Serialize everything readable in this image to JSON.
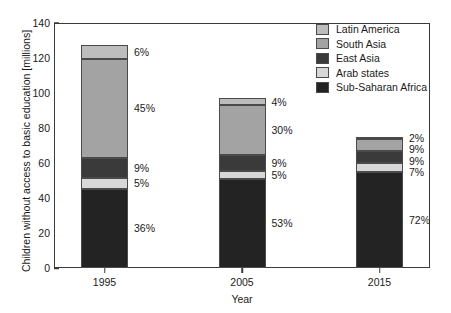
{
  "chart_data": {
    "type": "bar",
    "stacked": true,
    "title": "",
    "xlabel": "Year",
    "ylabel": "Children without access to basic education [millions]",
    "categories": [
      "1995",
      "2005",
      "2015"
    ],
    "ylim": [
      0,
      140
    ],
    "yticks": [
      0,
      20,
      40,
      60,
      80,
      100,
      120,
      140
    ],
    "grid": false,
    "legend_position": "top-right",
    "totals": [
      126,
      96,
      76
    ],
    "series": [
      {
        "name": "Sub-Saharan Africa",
        "color": "#232323",
        "values": [
          45.4,
          50.9,
          54.7
        ],
        "percent_labels": [
          "36%",
          "53%",
          "72%"
        ]
      },
      {
        "name": "Arab states",
        "color": "#d7d7d7",
        "values": [
          6.3,
          4.8,
          5.3
        ],
        "percent_labels": [
          "5%",
          "5%",
          "7%"
        ]
      },
      {
        "name": "East Asia",
        "color": "#3a3a3a",
        "values": [
          11.3,
          8.6,
          6.8
        ],
        "percent_labels": [
          "9%",
          "9%",
          "9%"
        ]
      },
      {
        "name": "South Asia",
        "color": "#a3a3a3",
        "values": [
          56.7,
          28.8,
          6.8
        ],
        "percent_labels": [
          "45%",
          "30%",
          "9%"
        ]
      },
      {
        "name": "Latin America",
        "color": "#bdbdbd",
        "values": [
          7.6,
          3.8,
          1.5
        ],
        "percent_labels": [
          "6%",
          "4%",
          "2%"
        ]
      }
    ],
    "legend_entries": [
      {
        "label": "Latin America",
        "color": "#bdbdbd"
      },
      {
        "label": "South Asia",
        "color": "#a3a3a3"
      },
      {
        "label": "East Asia",
        "color": "#3a3a3a"
      },
      {
        "label": "Arab states",
        "color": "#d7d7d7"
      },
      {
        "label": "Sub-Saharan Africa",
        "color": "#232323"
      }
    ]
  }
}
